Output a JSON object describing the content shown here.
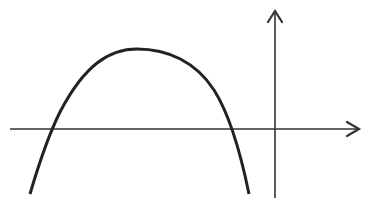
{
  "diagram": {
    "type": "function-graph",
    "colors": {
      "background": "#ffffff",
      "curve": "#222222",
      "axes": "#333333"
    },
    "axes": {
      "x_axis": {
        "x1": 10,
        "y": 129,
        "x2": 359,
        "arrow": "right"
      },
      "y_axis": {
        "x": 275,
        "y1": 198,
        "y2": 11,
        "arrow": "up"
      },
      "labels": []
    },
    "curve": {
      "shape": "downward-opening",
      "left_end": [
        30,
        194
      ],
      "left_root": [
        53,
        129
      ],
      "vertex": [
        137,
        49
      ],
      "right_root": [
        231,
        129
      ],
      "right_end": [
        249,
        194
      ],
      "path": "M30,194 C40,160 50,132 60,112 C85,64 110,49 137,49 C168,49 196,62 214,90 C228,112 240,150 249,194"
    }
  }
}
